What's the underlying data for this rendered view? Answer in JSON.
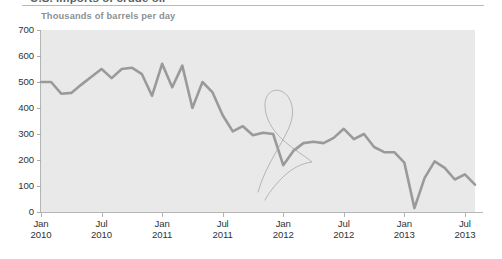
{
  "figure": {
    "clipped_title": "U.S. imports of crude oil",
    "axis_note": "Thousands of barrels per day",
    "line_color": "#9a9a9a",
    "plot_band_color": "#e9e9e9",
    "annotation_color": "#a9a3ab"
  },
  "chart_data": {
    "type": "line",
    "title": "U.S. imports of crude oil",
    "subtitle": "Thousands of barrels per day",
    "xlabel": "",
    "ylabel": "Thousands of barrels per day",
    "ylim": [
      0,
      700
    ],
    "ytick_values": [
      0,
      100,
      200,
      300,
      400,
      500,
      600,
      700
    ],
    "ytick_labels": [
      "0",
      "100",
      "200",
      "300",
      "400",
      "500",
      "600",
      "700"
    ],
    "xtick_labels": [
      {
        "month": "Jan",
        "year": "2010"
      },
      {
        "month": "Jul",
        "year": "2010"
      },
      {
        "month": "Jan",
        "year": "2011"
      },
      {
        "month": "Jul",
        "year": "2011"
      },
      {
        "month": "Jan",
        "year": "2012"
      },
      {
        "month": "Jul",
        "year": "2012"
      },
      {
        "month": "Jan",
        "year": "2013"
      },
      {
        "month": "Jul",
        "year": "2013"
      }
    ],
    "xtick_indices": [
      0,
      6,
      12,
      18,
      24,
      30,
      36,
      42
    ],
    "grid": false,
    "legend": null,
    "x": [
      "Jan 2010",
      "Feb 2010",
      "Mar 2010",
      "Apr 2010",
      "May 2010",
      "Jun 2010",
      "Jul 2010",
      "Aug 2010",
      "Sep 2010",
      "Oct 2010",
      "Nov 2010",
      "Dec 2010",
      "Jan 2011",
      "Feb 2011",
      "Mar 2011",
      "Apr 2011",
      "May 2011",
      "Jun 2011",
      "Jul 2011",
      "Aug 2011",
      "Sep 2011",
      "Oct 2011",
      "Nov 2011",
      "Dec 2011",
      "Jan 2012",
      "Feb 2012",
      "Mar 2012",
      "Apr 2012",
      "May 2012",
      "Jun 2012",
      "Jul 2012",
      "Aug 2012",
      "Sep 2012",
      "Oct 2012",
      "Nov 2012",
      "Dec 2012",
      "Jan 2013",
      "Feb 2013",
      "Mar 2013",
      "Apr 2013",
      "May 2013",
      "Jun 2013",
      "Jul 2013",
      "Aug 2013"
    ],
    "values": [
      500,
      500,
      455,
      458,
      490,
      520,
      550,
      515,
      550,
      555,
      530,
      447,
      570,
      480,
      563,
      400,
      500,
      460,
      372,
      310,
      330,
      295,
      305,
      300,
      180,
      235,
      265,
      270,
      265,
      285,
      320,
      280,
      300,
      250,
      230,
      230,
      190,
      15,
      130,
      195,
      170,
      125,
      145,
      105
    ],
    "annotations": [
      {
        "type": "handwritten-loop",
        "shape": "balloon",
        "x_range": [
          "Dec 2011",
          "Apr 2012"
        ],
        "note": "hand-drawn pen loop over early-2012 region"
      }
    ]
  }
}
